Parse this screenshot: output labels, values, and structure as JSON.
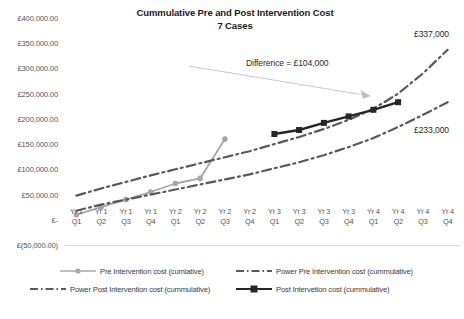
{
  "chart_data": {
    "type": "line",
    "title": "Cummulative Pre and Post Intervention Cost",
    "subtitle": "7 Cases",
    "xlabel": "",
    "ylabel": "",
    "ylim": [
      -50000,
      400000
    ],
    "ytick_labels": [
      "£400,000.00",
      "£350,000.00",
      "£300,000.00",
      "£250,000.00",
      "£200,000.00",
      "£150,000.00",
      "£100,000.00",
      "£50,000.00",
      "£-",
      "£(50,000.00)"
    ],
    "ytick_values": [
      400000,
      350000,
      300000,
      250000,
      200000,
      150000,
      100000,
      50000,
      0,
      -50000
    ],
    "categories": [
      "Yr 1 Q1",
      "Yr 1 Q2",
      "Yr 1 Q3",
      "Yr 1 Q4",
      "Yr 2 Q1",
      "Yr 2 Q2",
      "Yr 2 Q3",
      "Yr 2 Q4",
      "Yr 3 Q1",
      "Yr 3 Q2",
      "Yr 3 Q3",
      "Yr 3 Q4",
      "Yr 4 Q1",
      "Yr 4 Q2",
      "Yr 4 Q3",
      "Yr 4 Q4"
    ],
    "category_lines": [
      [
        "Yr 1",
        "Q1"
      ],
      [
        "Yr 1",
        "Q2"
      ],
      [
        "Yr 1",
        "Q3"
      ],
      [
        "Yr 1",
        "Q4"
      ],
      [
        "Yr 2",
        "Q1"
      ],
      [
        "Yr 2",
        "Q2"
      ],
      [
        "Yr 2",
        "Q3"
      ],
      [
        "Yr 2",
        "Q4"
      ],
      [
        "Yr 3",
        "Q1"
      ],
      [
        "Yr 3",
        "Q2"
      ],
      [
        "Yr 3",
        "Q3"
      ],
      [
        "Yr 3",
        "Q4"
      ],
      [
        "Yr 4",
        "Q1"
      ],
      [
        "Yr 4",
        "Q2"
      ],
      [
        "Yr 4",
        "Q3"
      ],
      [
        "Yr 4",
        "Q4"
      ]
    ],
    "grid": false,
    "legend_position": "bottom",
    "series": [
      {
        "name": "Pre Intervention cost (cumlative)",
        "style": "solid",
        "marker": "circle",
        "color": "#a6a6a6",
        "values": [
          10000,
          25000,
          40000,
          55000,
          72000,
          82000,
          160000,
          null,
          null,
          null,
          null,
          null,
          null,
          null,
          null,
          null
        ]
      },
      {
        "name": "Power Pre Intervention cost (cummulative)",
        "style": "dash-dot",
        "marker": "none",
        "color": "#595959",
        "values": [
          48000,
          62000,
          75000,
          88000,
          100000,
          112000,
          124000,
          136000,
          150000,
          164000,
          180000,
          198000,
          220000,
          250000,
          290000,
          337000
        ]
      },
      {
        "name": "Power Post Intervention cost (cummulative)",
        "style": "dash-dot",
        "marker": "none",
        "color": "#595959",
        "values": [
          18000,
          30000,
          40000,
          50000,
          60000,
          70000,
          80000,
          90000,
          102000,
          114000,
          128000,
          144000,
          162000,
          184000,
          208000,
          233000
        ]
      },
      {
        "name": "Post Intervetion cost (cummulative)",
        "style": "solid",
        "marker": "square",
        "color": "#262626",
        "values": [
          null,
          null,
          null,
          null,
          null,
          null,
          null,
          null,
          170000,
          178000,
          192000,
          205000,
          218000,
          233000,
          null,
          null
        ]
      }
    ],
    "annotations": [
      {
        "id": "difference",
        "text": "Difference = £104,000"
      },
      {
        "id": "pre-end-value",
        "text": "£337,000"
      },
      {
        "id": "post-end-value",
        "text": "£233,000"
      }
    ]
  },
  "legend": {
    "items": [
      {
        "label": "Pre Intervention cost (cumlative)"
      },
      {
        "label": "Power Pre Intervention cost (cummulative)"
      },
      {
        "label": "Power Post Intervention cost (cummulative)"
      },
      {
        "label": "Post Intervetion cost (cummulative)"
      }
    ]
  },
  "colors": {
    "pre_line": "#a6a6a6",
    "post_line": "#262626",
    "trend_line": "#595959",
    "axis_text": "#555555",
    "title_text": "#1a1a1a",
    "baseline": "#d9d9d9",
    "leader": "#c8c8c8"
  }
}
